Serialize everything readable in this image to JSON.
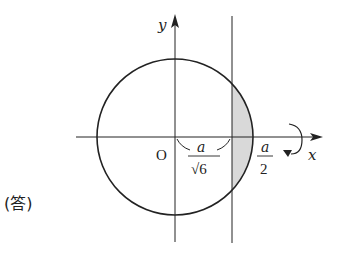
{
  "answer_label": "(答)",
  "axes": {
    "x_label": "x",
    "y_label": "y",
    "origin_label": "O"
  },
  "labels": {
    "inner_numerator": "a",
    "inner_denominator": "√6",
    "outer_numerator": "a",
    "outer_denominator": "2"
  },
  "diagram": {
    "shape": "circle centered at origin",
    "radius_label": "a/2",
    "vertical_line_at": "a/√6",
    "shaded_region": "circular segment between x = a/√6 and x = a/2",
    "rotation_indicator": "rotation about x-axis",
    "colors": {
      "stroke": "#222222",
      "shade": "#d9d9d9"
    }
  }
}
